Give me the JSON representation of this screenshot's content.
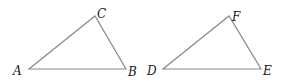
{
  "diagram": {
    "type": "geometry",
    "stroke_color": "#8a8a8a",
    "label_color": "#1a1a1a",
    "triangles": [
      {
        "name": "ABC",
        "vertices": [
          {
            "label": "A",
            "x": 29,
            "y": 69,
            "lx": 13,
            "ly": 75
          },
          {
            "label": "B",
            "x": 126,
            "y": 69,
            "lx": 128,
            "ly": 76
          },
          {
            "label": "C",
            "x": 95,
            "y": 16,
            "lx": 97,
            "ly": 18
          }
        ]
      },
      {
        "name": "DEF",
        "vertices": [
          {
            "label": "D",
            "x": 163,
            "y": 69,
            "lx": 147,
            "ly": 75
          },
          {
            "label": "E",
            "x": 261,
            "y": 69,
            "lx": 263,
            "ly": 75
          },
          {
            "label": "F",
            "x": 229,
            "y": 16,
            "lx": 232,
            "ly": 21
          }
        ]
      }
    ]
  }
}
